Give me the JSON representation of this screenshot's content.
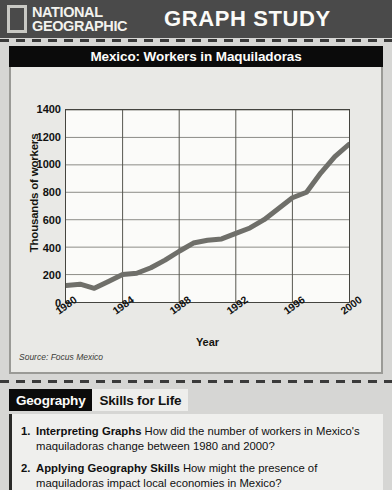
{
  "banner": {
    "logo_line1": "NATIONAL",
    "logo_line2": "GEOGRAPHIC",
    "section_title": "GRAPH STUDY"
  },
  "chart_title": "Mexico: Workers in Maquiladoras",
  "source": "Source: Focus Mexico",
  "tabs": [
    {
      "label": "Geography",
      "active": true
    },
    {
      "label": "Skills for Life",
      "active": false
    }
  ],
  "questions": [
    {
      "number": "1.",
      "lead": "Interpreting Graphs",
      "text": " How did the number of workers in Mexico's maquiladoras change between 1980 and 2000?"
    },
    {
      "number": "2.",
      "lead": "Applying Geography Skills",
      "text": " How might the presence of maquiladoras impact local economies in Mexico?"
    }
  ],
  "chart_data": {
    "type": "line",
    "title": "Mexico: Workers in Maquiladoras",
    "xlabel": "Year",
    "ylabel": "Thousands of workers",
    "xlim": [
      1980,
      2000
    ],
    "ylim": [
      0,
      1400
    ],
    "yticks": [
      0,
      200,
      400,
      600,
      800,
      1000,
      1200,
      1400
    ],
    "xticks": [
      1980,
      1984,
      1988,
      1992,
      1996,
      2000
    ],
    "grid": true,
    "legend": "none",
    "line_color": "#6f6f6a",
    "x": [
      1980,
      1981,
      1982,
      1983,
      1984,
      1985,
      1986,
      1987,
      1988,
      1989,
      1990,
      1991,
      1992,
      1993,
      1994,
      1995,
      1996,
      1997,
      1998,
      1999,
      2000
    ],
    "values": [
      120,
      130,
      100,
      150,
      200,
      210,
      250,
      305,
      370,
      430,
      450,
      460,
      500,
      540,
      600,
      680,
      760,
      800,
      940,
      1060,
      1150
    ]
  }
}
